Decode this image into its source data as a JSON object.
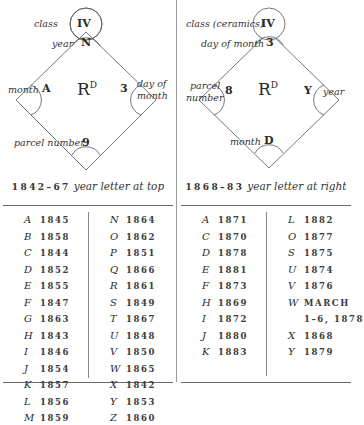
{
  "left_panel": {
    "diagram": {
      "top_circle": "IV",
      "top_circle_label": "class",
      "top_corner": "N",
      "top_corner_label": "year",
      "left_corner": "A",
      "left_corner_label": "month",
      "center": "R",
      "center_sup": "D",
      "right_corner": "3",
      "right_corner_label_1": "day of",
      "right_corner_label_2": "month",
      "bottom_corner": "9",
      "bottom_corner_label": "parcel number"
    },
    "caption": {
      "years": "1842–67",
      "text": "year letter at top"
    },
    "table": {
      "columns": [
        [
          {
            "letter": "A",
            "year": "1845"
          },
          {
            "letter": "B",
            "year": "1858"
          },
          {
            "letter": "C",
            "year": "1844"
          },
          {
            "letter": "D",
            "year": "1852"
          },
          {
            "letter": "E",
            "year": "1855"
          },
          {
            "letter": "F",
            "year": "1847"
          },
          {
            "letter": "G",
            "year": "1863"
          },
          {
            "letter": "H",
            "year": "1843"
          },
          {
            "letter": "I",
            "year": "1846"
          },
          {
            "letter": "J",
            "year": "1854"
          },
          {
            "letter": "K",
            "year": "1857"
          },
          {
            "letter": "L",
            "year": "1856"
          },
          {
            "letter": "M",
            "year": "1859"
          }
        ],
        [
          {
            "letter": "N",
            "year": "1864"
          },
          {
            "letter": "O",
            "year": "1862"
          },
          {
            "letter": "P",
            "year": "1851"
          },
          {
            "letter": "Q",
            "year": "1866"
          },
          {
            "letter": "R",
            "year": "1861"
          },
          {
            "letter": "S",
            "year": "1849"
          },
          {
            "letter": "T",
            "year": "1867"
          },
          {
            "letter": "U",
            "year": "1848"
          },
          {
            "letter": "V",
            "year": "1850"
          },
          {
            "letter": "W",
            "year": "1865"
          },
          {
            "letter": "X",
            "year": "1842"
          },
          {
            "letter": "Y",
            "year": "1853"
          },
          {
            "letter": "Z",
            "year": "1860"
          }
        ]
      ]
    }
  },
  "right_panel": {
    "diagram": {
      "top_circle": "IV",
      "top_circle_label": "class (ceramics)",
      "top_corner": "3",
      "top_corner_label": "day of month",
      "left_corner": "8",
      "left_corner_label_1": "parcel",
      "left_corner_label_2": "number",
      "center": "R",
      "center_sup": "D",
      "right_corner": "Y",
      "right_corner_label": "year",
      "bottom_corner": "D",
      "bottom_corner_label": "month"
    },
    "caption": {
      "years": "1868–83",
      "text": "year letter at right"
    },
    "table": {
      "columns": [
        [
          {
            "letter": "A",
            "year": "1871"
          },
          {
            "letter": "C",
            "year": "1870"
          },
          {
            "letter": "D",
            "year": "1878"
          },
          {
            "letter": "E",
            "year": "1881"
          },
          {
            "letter": "F",
            "year": "1873"
          },
          {
            "letter": "H",
            "year": "1869"
          },
          {
            "letter": "I",
            "year": "1872"
          },
          {
            "letter": "J",
            "year": "1880"
          },
          {
            "letter": "K",
            "year": "1883"
          }
        ],
        [
          {
            "letter": "L",
            "year": "1882"
          },
          {
            "letter": "O",
            "year": "1877"
          },
          {
            "letter": "S",
            "year": "1875"
          },
          {
            "letter": "U",
            "year": "1874"
          },
          {
            "letter": "V",
            "year": "1876"
          },
          {
            "letter": "W",
            "year": "MARCH"
          },
          {
            "letter": "",
            "year": "1–6, 1878"
          },
          {
            "letter": "X",
            "year": "1868"
          },
          {
            "letter": "Y",
            "year": "1879"
          }
        ]
      ]
    }
  }
}
